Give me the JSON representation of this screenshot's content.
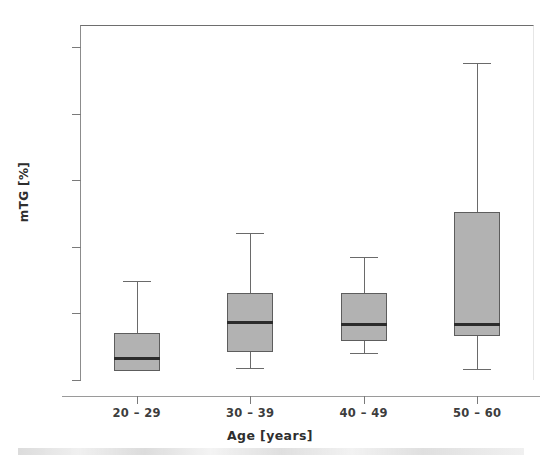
{
  "chart_data": {
    "type": "box",
    "title": "",
    "xlabel": "Age [years]",
    "ylabel": "mTG [%]",
    "categories": [
      "20 – 29",
      "30 – 39",
      "40 – 49",
      "50 – 60"
    ],
    "ylim": [
      -0.12,
      2.62
    ],
    "ytick_values": [
      2.5,
      2.0,
      1.5,
      1.0,
      0.5,
      0.0
    ],
    "ytick_labels": [
      "2.50",
      "2.00",
      "1.50",
      "1.00",
      ".50",
      ".00"
    ],
    "grid": false,
    "legend": null,
    "box_fill_color": "#b2b2b2",
    "box_edge_color": "#5d5d5d",
    "median_color": "#2b2b2b",
    "boxes": [
      {
        "category": "20 – 29",
        "whisker_low": 0.07,
        "q1": 0.07,
        "median": 0.16,
        "q3": 0.35,
        "whisker_high": 0.74
      },
      {
        "category": "30 – 39",
        "whisker_low": 0.09,
        "q1": 0.21,
        "median": 0.43,
        "q3": 0.65,
        "whisker_high": 1.1
      },
      {
        "category": "40 – 49",
        "whisker_low": 0.2,
        "q1": 0.29,
        "median": 0.42,
        "q3": 0.65,
        "whisker_high": 0.92
      },
      {
        "category": "50 – 60",
        "whisker_low": 0.08,
        "q1": 0.33,
        "median": 0.42,
        "q3": 1.26,
        "whisker_high": 2.38
      }
    ]
  }
}
